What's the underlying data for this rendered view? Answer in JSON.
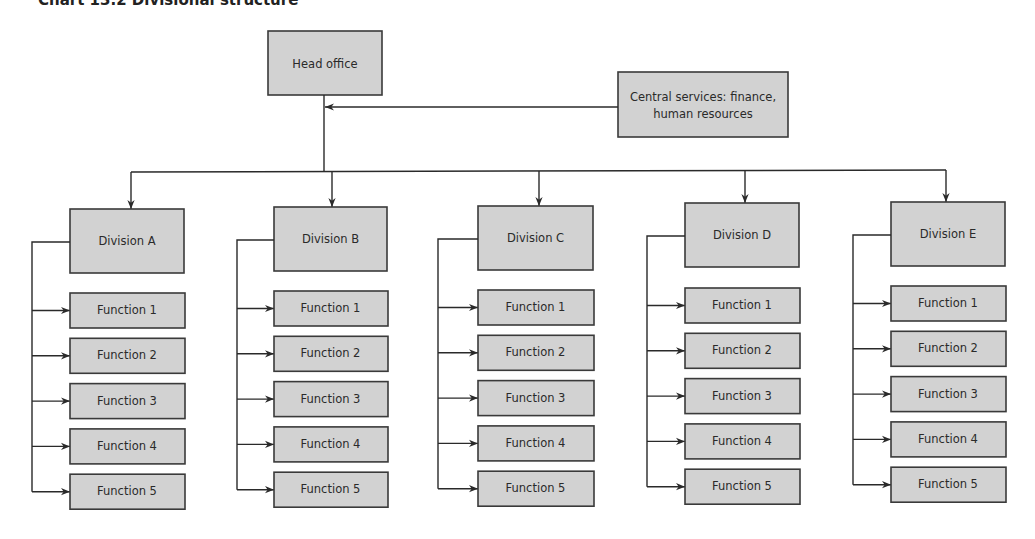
{
  "title": "Chart 13.2  Divisional structure",
  "head_office": {
    "label": "Head office"
  },
  "central_services": {
    "label_line1": "Central services: finance,",
    "label_line2": "human resources"
  },
  "divisions": [
    {
      "label": "Division A",
      "functions": [
        "Function 1",
        "Function 2",
        "Function 3",
        "Function 4",
        "Function 5"
      ]
    },
    {
      "label": "Division B",
      "functions": [
        "Function 1",
        "Function 2",
        "Function 3",
        "Function 4",
        "Function 5"
      ]
    },
    {
      "label": "Division C",
      "functions": [
        "Function 1",
        "Function 2",
        "Function 3",
        "Function 4",
        "Function 5"
      ]
    },
    {
      "label": "Division D",
      "functions": [
        "Function 1",
        "Function 2",
        "Function 3",
        "Function 4",
        "Function 5"
      ]
    },
    {
      "label": "Division E",
      "functions": [
        "Function 1",
        "Function 2",
        "Function 3",
        "Function 4",
        "Function 5"
      ]
    }
  ],
  "colors": {
    "box_fill": "#d2d2d2",
    "box_stroke": "#3a3a3a",
    "line": "#2a2a2a"
  }
}
